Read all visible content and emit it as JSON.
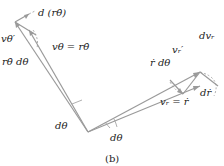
{
  "labels": {
    "d_r_theta_dot": "d (rθ̇)",
    "v_theta_prime": "vθ′",
    "v_theta_eq": "vθ = rθ̇",
    "r_theta_dot_dtheta": "rθ̇ dθ",
    "d_v_r": "dvᵣ",
    "v_r_prime": "vᵣ′",
    "r_dot_dtheta": "ṙ dθ",
    "d_r_dot": "dṙ",
    "v_r_eq": "vᵣ = ṙ",
    "dtheta_left": "dθ",
    "dtheta_right": "dθ"
  },
  "caption": "(b)",
  "colors": {
    "line": "#9a9a9a",
    "text": "#222222",
    "dashed": "#9a9a9a"
  }
}
